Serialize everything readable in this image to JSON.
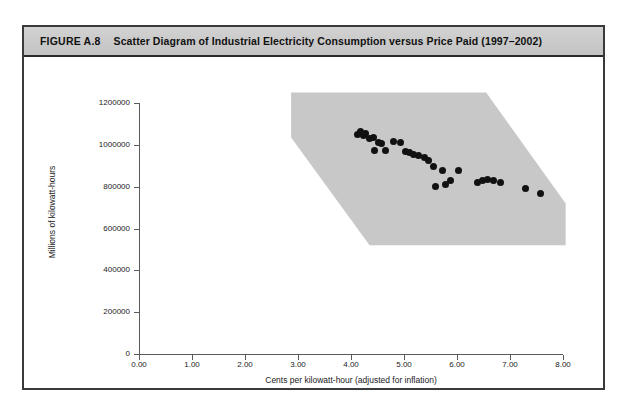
{
  "figure": {
    "number": "FIGURE A.8",
    "title": "Scatter Diagram of Industrial Electricity Consumption versus Price Paid (1997–2002)"
  },
  "colors": {
    "frame": "#3a3a3a",
    "title_bar": "#c9c9c9",
    "band": "#c8c8c8",
    "point": "#111111",
    "axis": "#5a5a5a"
  },
  "chart_data": {
    "type": "scatter",
    "title": "Scatter Diagram of Industrial Electricity Consumption versus Price Paid (1997–2002)",
    "xlabel": "Cents per kilowatt-hour (adjusted for inflation)",
    "ylabel": "Millions of kilowatt-hours",
    "xlim": [
      0.0,
      8.0
    ],
    "ylim": [
      0,
      1200000
    ],
    "xticks": [
      "0.00",
      "1.00",
      "2.00",
      "3.00",
      "4.00",
      "5.00",
      "6.00",
      "7.00",
      "8.00"
    ],
    "xtick_values": [
      0.0,
      1.0,
      2.0,
      3.0,
      4.0,
      5.0,
      6.0,
      7.0,
      8.0
    ],
    "yticks": [
      "0",
      "200000",
      "400000",
      "600000",
      "800000",
      "1000000",
      "1200000"
    ],
    "ytick_values": [
      0,
      200000,
      400000,
      600000,
      800000,
      1000000,
      1200000
    ],
    "grid": false,
    "legend": null,
    "band": {
      "label": "shaded trend band",
      "fill": "#c8c8c8",
      "polygon_xy": [
        [
          2.87,
          1250000
        ],
        [
          6.55,
          1250000
        ],
        [
          8.05,
          720000
        ],
        [
          8.05,
          520000
        ],
        [
          4.35,
          520000
        ],
        [
          2.87,
          1035000
        ]
      ]
    },
    "series": [
      {
        "name": "States / observations",
        "marker": "filled circle",
        "points": [
          [
            4.12,
            1048000
          ],
          [
            4.18,
            1062000
          ],
          [
            4.23,
            1043000
          ],
          [
            4.28,
            1055000
          ],
          [
            4.35,
            1032000
          ],
          [
            4.42,
            1035000
          ],
          [
            4.45,
            975000
          ],
          [
            4.52,
            1010000
          ],
          [
            4.58,
            1008000
          ],
          [
            4.66,
            972000
          ],
          [
            4.8,
            1015000
          ],
          [
            4.94,
            1010000
          ],
          [
            5.02,
            968000
          ],
          [
            5.1,
            963000
          ],
          [
            5.18,
            952000
          ],
          [
            5.28,
            948000
          ],
          [
            5.38,
            940000
          ],
          [
            5.47,
            925000
          ],
          [
            5.55,
            895000
          ],
          [
            5.6,
            800000
          ],
          [
            5.72,
            878000
          ],
          [
            5.78,
            812000
          ],
          [
            5.88,
            830000
          ],
          [
            6.02,
            878000
          ],
          [
            6.38,
            822000
          ],
          [
            6.48,
            830000
          ],
          [
            6.58,
            835000
          ],
          [
            6.68,
            828000
          ],
          [
            6.82,
            822000
          ],
          [
            7.3,
            790000
          ],
          [
            7.58,
            765000
          ]
        ]
      }
    ]
  }
}
